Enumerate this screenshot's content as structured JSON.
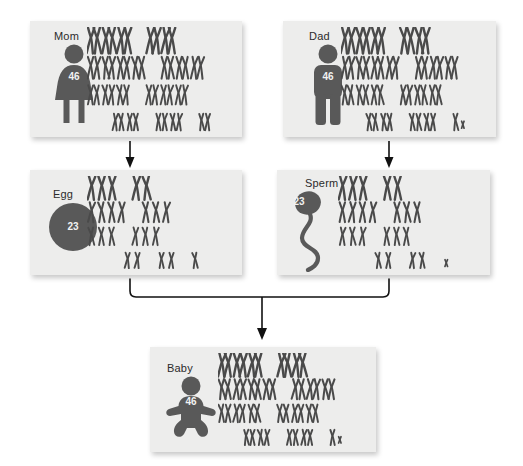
{
  "diagram": {
    "palette": {
      "card_bg": "#ededec",
      "figure": "#595959",
      "chromosome": "#4a4a4a",
      "text": "#2b2b2b",
      "count_text": "#f2f2f2",
      "connector": "#111111",
      "page_bg": "#ffffff"
    }
  },
  "cards": {
    "mom": {
      "label": "Mom",
      "count": "46",
      "icon": "female-figure-icon",
      "chromosome_count_visible": "46"
    },
    "dad": {
      "label": "Dad",
      "count": "46",
      "icon": "male-figure-icon",
      "chromosome_count_visible": "46"
    },
    "egg": {
      "label": "Egg",
      "count": "23",
      "icon": "egg-cell-icon",
      "chromosome_count_visible": "23"
    },
    "sperm": {
      "label": "Sperm",
      "count": "23",
      "icon": "sperm-cell-icon",
      "chromosome_count_visible": "23"
    },
    "baby": {
      "label": "Baby",
      "count": "46",
      "icon": "baby-figure-icon",
      "chromosome_count_visible": "46"
    }
  },
  "connectors": {
    "mom_to_egg": "arrow-down",
    "dad_to_sperm": "arrow-down",
    "parents_to_baby": "bracket-merge-arrow-down"
  },
  "karyotype_layout": {
    "paired": {
      "description": "diploid karyotype, 4 rows of chromosome pairs",
      "rows": [
        {
          "groups": [
            3,
            2
          ]
        },
        {
          "groups": [
            4,
            3
          ]
        },
        {
          "groups": [
            3,
            3
          ]
        },
        {
          "groups": [
            2,
            2,
            1
          ]
        }
      ]
    },
    "single": {
      "description": "haploid set, 4 rows of single chromosomes",
      "rows": [
        {
          "groups": [
            3,
            2
          ]
        },
        {
          "groups": [
            4,
            3
          ]
        },
        {
          "groups": [
            3,
            3
          ]
        },
        {
          "groups": [
            2,
            2,
            1
          ]
        }
      ]
    }
  }
}
